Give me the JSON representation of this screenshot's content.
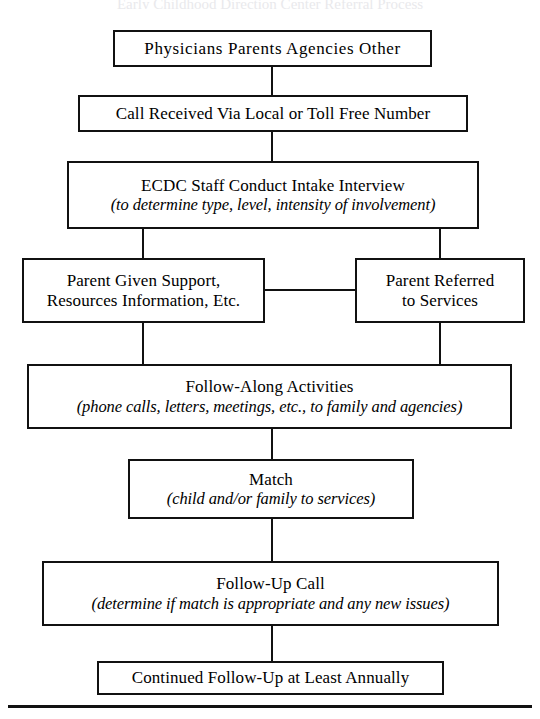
{
  "document": {
    "title_sliver": "Early Childhood Direction Center Referral Process",
    "footer_rule": "horizontal-rule"
  },
  "diagram": {
    "type": "flowchart",
    "orientation": "top-to-bottom",
    "nodes": [
      {
        "id": "sources",
        "line1": "Physicians  Parents  Agencies  Other",
        "line2": ""
      },
      {
        "id": "call_received",
        "line1": "Call Received Via Local or Toll Free Number",
        "line2": ""
      },
      {
        "id": "intake",
        "line1": "ECDC Staff Conduct Intake Interview",
        "line2": "(to determine type, level, intensity of involvement)"
      },
      {
        "id": "parent_support",
        "line1": "Parent Given Support,",
        "line2": "Resources Information, Etc."
      },
      {
        "id": "parent_referred",
        "line1": "Parent Referred",
        "line2": "to Services"
      },
      {
        "id": "follow_along",
        "line1": "Follow-Along Activities",
        "line2": "(phone calls, letters, meetings, etc., to family and agencies)"
      },
      {
        "id": "match",
        "line1": "Match",
        "line2": "(child and/or family to services)"
      },
      {
        "id": "follow_up",
        "line1": "Follow-Up Call",
        "line2": "(determine if match is appropriate and any new issues)"
      },
      {
        "id": "continued",
        "line1": "Continued Follow-Up at Least Annually",
        "line2": ""
      }
    ],
    "edges": [
      {
        "from": "sources",
        "to": "call_received",
        "kind": "vertical"
      },
      {
        "from": "call_received",
        "to": "intake",
        "kind": "vertical"
      },
      {
        "from": "intake",
        "to": "parent_support",
        "kind": "vertical"
      },
      {
        "from": "intake",
        "to": "parent_referred",
        "kind": "vertical"
      },
      {
        "from": "parent_support",
        "to": "parent_referred",
        "kind": "horizontal"
      },
      {
        "from": "parent_support",
        "to": "follow_along",
        "kind": "vertical"
      },
      {
        "from": "parent_referred",
        "to": "follow_along",
        "kind": "vertical"
      },
      {
        "from": "follow_along",
        "to": "match",
        "kind": "vertical"
      },
      {
        "from": "match",
        "to": "follow_up",
        "kind": "vertical"
      },
      {
        "from": "follow_up",
        "to": "continued",
        "kind": "vertical"
      }
    ],
    "colors": {
      "stroke": "#111111",
      "fill": "#ffffff",
      "text": "#000000"
    }
  }
}
